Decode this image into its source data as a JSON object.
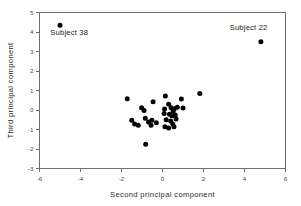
{
  "chart_data": {
    "type": "scatter",
    "title": "",
    "xlabel": "Second principal component",
    "ylabel": "Third principal component",
    "xlim": [
      -6,
      6
    ],
    "ylim": [
      -3,
      5
    ],
    "xticks": [
      -6,
      -4,
      -2,
      0,
      2,
      4,
      6
    ],
    "xtick_labels": [
      "-6",
      "-4",
      "-2",
      "0",
      "2",
      "4",
      "6"
    ],
    "yticks": [
      -3,
      -2,
      -1,
      0,
      1,
      2,
      3,
      4,
      5
    ],
    "ytick_labels": [
      "-3",
      "-2",
      "-1",
      "0",
      "1",
      "2",
      "3",
      "4",
      "5"
    ],
    "grid": false,
    "legend": null,
    "marker": "filled-circle",
    "marker_color": "#000000",
    "points": [
      {
        "x": -5.0,
        "y": 4.35
      },
      {
        "x": 4.8,
        "y": 3.5
      },
      {
        "x": -1.72,
        "y": 0.58
      },
      {
        "x": 1.82,
        "y": 0.85
      },
      {
        "x": 0.14,
        "y": 0.72
      },
      {
        "x": 0.92,
        "y": 0.56
      },
      {
        "x": -0.46,
        "y": 0.42
      },
      {
        "x": 0.3,
        "y": 0.3
      },
      {
        "x": -1.02,
        "y": 0.12
      },
      {
        "x": -0.9,
        "y": -0.02
      },
      {
        "x": 0.1,
        "y": 0.05
      },
      {
        "x": 0.42,
        "y": 0.12
      },
      {
        "x": 0.58,
        "y": 0.06
      },
      {
        "x": 0.72,
        "y": 0.14
      },
      {
        "x": 0.52,
        "y": -0.05
      },
      {
        "x": 1.0,
        "y": 0.1
      },
      {
        "x": 0.08,
        "y": -0.18
      },
      {
        "x": 0.34,
        "y": -0.22
      },
      {
        "x": 0.46,
        "y": -0.3
      },
      {
        "x": 0.62,
        "y": -0.26
      },
      {
        "x": -1.5,
        "y": -0.52
      },
      {
        "x": -1.36,
        "y": -0.72
      },
      {
        "x": -1.18,
        "y": -0.78
      },
      {
        "x": -0.84,
        "y": -0.42
      },
      {
        "x": -0.68,
        "y": -0.62
      },
      {
        "x": -0.52,
        "y": -0.52
      },
      {
        "x": -0.56,
        "y": -0.78
      },
      {
        "x": -0.3,
        "y": -0.66
      },
      {
        "x": 0.18,
        "y": -0.5
      },
      {
        "x": 0.4,
        "y": -0.56
      },
      {
        "x": 0.5,
        "y": -0.72
      },
      {
        "x": 0.56,
        "y": -0.86
      },
      {
        "x": 0.3,
        "y": -0.92
      },
      {
        "x": 0.12,
        "y": -0.86
      },
      {
        "x": 0.66,
        "y": -0.46
      },
      {
        "x": -0.82,
        "y": -1.75
      }
    ],
    "annotations": [
      {
        "label": "Subject 38",
        "x": -5.0,
        "y": 4.35,
        "text_x": -4.55,
        "text_y": 3.86,
        "anchor": "middle"
      },
      {
        "label": "Subject 22",
        "x": 4.8,
        "y": 3.5,
        "text_x": 4.2,
        "text_y": 4.12,
        "anchor": "middle"
      }
    ]
  }
}
